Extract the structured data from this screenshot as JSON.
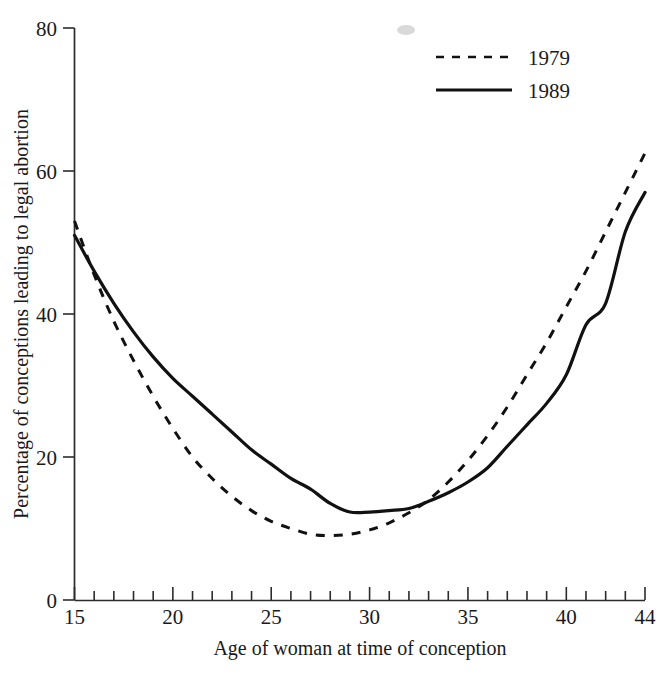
{
  "chart_data": {
    "type": "line",
    "title": "",
    "xlabel": "Age of woman at time of conception",
    "ylabel": "Percentage of conceptions leading to legal abortion",
    "xlim": [
      15,
      44
    ],
    "ylim": [
      0,
      80
    ],
    "grid": false,
    "legend_position": "top-right",
    "x_ticks_major": [
      15,
      20,
      25,
      30,
      35,
      40,
      44
    ],
    "x_tick_labels": [
      "15",
      "20",
      "25",
      "30",
      "35",
      "40",
      "44"
    ],
    "x_tick_minor_step": 1,
    "y_ticks": [
      0,
      20,
      40,
      60,
      80
    ],
    "y_tick_labels": [
      "0",
      "20",
      "40",
      "60",
      "80"
    ],
    "x": [
      15,
      16,
      17,
      18,
      19,
      20,
      21,
      22,
      23,
      24,
      25,
      26,
      27,
      28,
      29,
      30,
      31,
      32,
      33,
      34,
      35,
      36,
      37,
      38,
      39,
      40,
      41,
      42,
      43,
      44
    ],
    "series": [
      {
        "name": "1979",
        "style": "dashed",
        "color": "#111111",
        "values": [
          53.0,
          45.5,
          39.0,
          33.5,
          28.5,
          24.0,
          20.0,
          17.0,
          14.5,
          12.5,
          11.0,
          10.0,
          9.2,
          9.0,
          9.2,
          9.8,
          10.8,
          12.2,
          14.0,
          16.5,
          19.5,
          23.0,
          27.0,
          31.5,
          36.0,
          41.0,
          46.0,
          51.5,
          57.0,
          62.5
        ]
      },
      {
        "name": "1989",
        "style": "solid",
        "color": "#111111",
        "values": [
          51.0,
          46.0,
          41.5,
          37.5,
          34.0,
          31.0,
          28.5,
          26.0,
          23.5,
          21.0,
          19.0,
          17.0,
          15.5,
          13.5,
          12.3,
          12.3,
          12.5,
          12.8,
          13.8,
          15.0,
          16.5,
          18.5,
          21.5,
          24.5,
          27.5,
          31.5,
          38.5,
          41.5,
          51.5,
          57.0
        ]
      }
    ],
    "legend_entries": [
      {
        "label": "1979",
        "style": "dashed"
      },
      {
        "label": "1989",
        "style": "solid"
      }
    ]
  },
  "legend": {
    "entry_0_label": "1979",
    "entry_1_label": "1989"
  },
  "axes": {
    "x_title": "Age of woman at time of conception",
    "y_title": "Percentage of conceptions leading to legal abortion",
    "y_label_0": "0",
    "y_label_1": "20",
    "y_label_2": "40",
    "y_label_3": "60",
    "y_label_4": "80",
    "x_label_0": "15",
    "x_label_1": "20",
    "x_label_2": "25",
    "x_label_3": "30",
    "x_label_4": "35",
    "x_label_5": "40",
    "x_label_6": "44"
  }
}
